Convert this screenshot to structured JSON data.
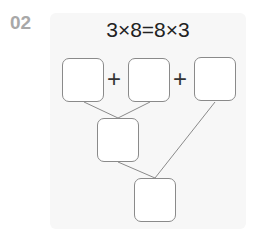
{
  "problem_number": "02",
  "equation": "3×8=8×3",
  "operators": [
    "+",
    "+"
  ],
  "boxes": {
    "top": [
      "",
      "",
      ""
    ],
    "middle": "",
    "bottom": ""
  },
  "colors": {
    "number": "#a8a8a8",
    "panel": "#f7f7f7",
    "box_border": "#8a8a8a",
    "line": "#8a8a8a"
  }
}
